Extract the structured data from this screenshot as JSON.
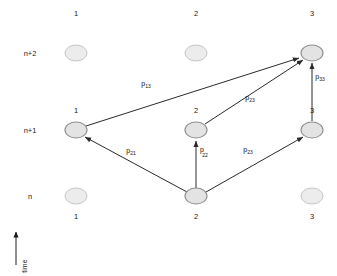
{
  "figure": {
    "type": "trellis-diagram",
    "background": "#ffffff",
    "node_fill": "#ececed",
    "node_stroke": "#b9b9bb",
    "edge_color": "#2a2a2a"
  },
  "axes": {
    "time_label": "time",
    "time_arrow_direction": "up"
  },
  "columns": [
    {
      "header": "1",
      "x": 76
    },
    {
      "header": "2",
      "x": 196
    },
    {
      "header": "3",
      "x": 312
    }
  ],
  "rows": [
    {
      "label": "n+2",
      "y": 53
    },
    {
      "label": "n+1",
      "y": 130
    },
    {
      "label": "n",
      "y": 196
    }
  ],
  "nodes": [
    {
      "id": "n2-c1",
      "row": "n+2",
      "col": "1",
      "cx": 76,
      "cy": 53,
      "rx": 11,
      "ry": 8,
      "active": false,
      "label": "",
      "label_pos": "none"
    },
    {
      "id": "n2-c2",
      "row": "n+2",
      "col": "2",
      "cx": 196,
      "cy": 53,
      "rx": 11,
      "ry": 8,
      "active": false,
      "label": "",
      "label_pos": "none"
    },
    {
      "id": "n2-c3",
      "row": "n+2",
      "col": "3",
      "cx": 312,
      "cy": 53,
      "rx": 11,
      "ry": 8,
      "active": true,
      "label": "",
      "label_pos": "none"
    },
    {
      "id": "n1-c1",
      "row": "n+1",
      "col": "1",
      "cx": 76,
      "cy": 130,
      "rx": 11,
      "ry": 8,
      "active": true,
      "label": "1",
      "label_pos": "above"
    },
    {
      "id": "n1-c2",
      "row": "n+1",
      "col": "2",
      "cx": 196,
      "cy": 130,
      "rx": 11,
      "ry": 8,
      "active": true,
      "label": "2",
      "label_pos": "above"
    },
    {
      "id": "n1-c3",
      "row": "n+1",
      "col": "3",
      "cx": 312,
      "cy": 130,
      "rx": 11,
      "ry": 8,
      "active": true,
      "label": "3",
      "label_pos": "above"
    },
    {
      "id": "n0-c1",
      "row": "n",
      "col": "1",
      "cx": 76,
      "cy": 196,
      "rx": 11,
      "ry": 8,
      "active": false,
      "label": "1",
      "label_pos": "below"
    },
    {
      "id": "n0-c2",
      "row": "n",
      "col": "2",
      "cx": 196,
      "cy": 196,
      "rx": 11,
      "ry": 8,
      "active": true,
      "label": "2",
      "label_pos": "below"
    },
    {
      "id": "n0-c3",
      "row": "n",
      "col": "3",
      "cx": 312,
      "cy": 196,
      "rx": 11,
      "ry": 8,
      "active": false,
      "label": "3",
      "label_pos": "below"
    }
  ],
  "edges": [
    {
      "id": "e-p13",
      "from": "n1-c1",
      "to": "n2-c3",
      "base": "p",
      "sub": "13",
      "label_x": 146,
      "label_y": 86
    },
    {
      "id": "e-p23",
      "from": "n1-c2",
      "to": "n2-c3",
      "base": "p",
      "sub": "23",
      "label_x": 250,
      "label_y": 100
    },
    {
      "id": "e-p33",
      "from": "n1-c3",
      "to": "n2-c3",
      "base": "p",
      "sub": "33",
      "label_x": 318,
      "label_y": 79
    },
    {
      "id": "e-p21",
      "from": "n0-c2",
      "to": "n1-c1",
      "base": "p",
      "sub": "21",
      "label_x": 131,
      "label_y": 153
    },
    {
      "id": "e-p22",
      "from": "n0-c2",
      "to": "n1-c2",
      "base": "p",
      "sub": "22",
      "label_x": 202,
      "label_y": 154
    },
    {
      "id": "e-p23b",
      "from": "n0-c2",
      "to": "n1-c3",
      "base": "p",
      "sub": "23",
      "label_x": 248,
      "label_y": 152
    }
  ]
}
